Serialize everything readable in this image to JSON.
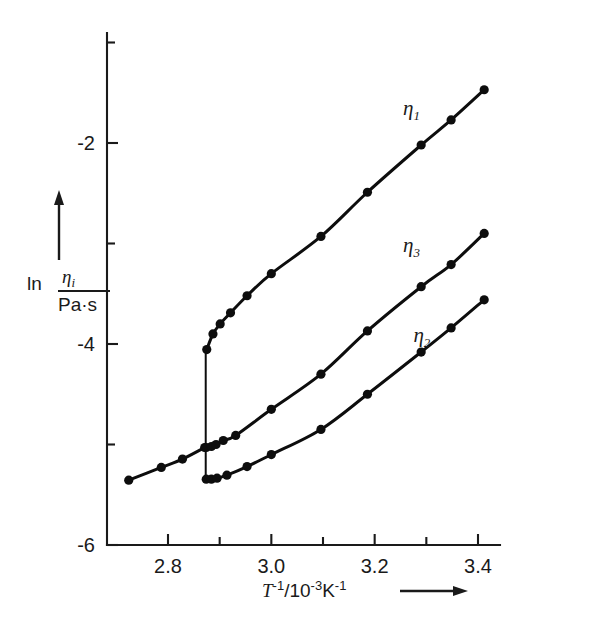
{
  "chart_data": {
    "type": "line",
    "title": "",
    "xlabel": "T^-1 / 10^-3 K^-1",
    "ylabel": "ln ( eta_i / Pa·s )",
    "xlim": [
      2.715,
      3.475
    ],
    "ylim": [
      -6.0,
      -1.28
    ],
    "xticks": [
      2.8,
      3.0,
      3.2,
      3.4
    ],
    "xticklabels": [
      "2.8",
      "3.0",
      "3.2",
      "3.4"
    ],
    "xminorticks": [
      2.9,
      3.1,
      3.3
    ],
    "yticks": [
      -2,
      -4,
      -6
    ],
    "yticklabels": [
      "-2",
      "-4",
      "-6"
    ],
    "yminorticks": [
      -1,
      -3,
      -5
    ],
    "grid": false,
    "legend_position": "inline-right",
    "annotations": [
      {
        "text": "eta_1",
        "x": 3.255,
        "y": -1.72
      },
      {
        "text": "eta_3",
        "x": 3.255,
        "y": -3.08
      },
      {
        "text": "eta_2",
        "x": 3.275,
        "y": -3.98
      }
    ],
    "transition_x": 2.873,
    "series": [
      {
        "name": "common-low-branch",
        "label": "shared branch",
        "points": [
          {
            "x": 2.724,
            "y": -5.355
          },
          {
            "x": 2.787,
            "y": -5.228
          },
          {
            "x": 2.828,
            "y": -5.145
          },
          {
            "x": 2.871,
            "y": -5.03
          }
        ]
      },
      {
        "name": "eta_1",
        "label": "η₁",
        "points": [
          {
            "x": 2.875,
            "y": -4.055
          },
          {
            "x": 2.887,
            "y": -3.9
          },
          {
            "x": 2.901,
            "y": -3.8
          },
          {
            "x": 2.921,
            "y": -3.69
          },
          {
            "x": 2.953,
            "y": -3.52
          },
          {
            "x": 3.0,
            "y": -3.3
          },
          {
            "x": 3.096,
            "y": -2.93
          },
          {
            "x": 3.186,
            "y": -2.49
          },
          {
            "x": 3.29,
            "y": -2.02
          },
          {
            "x": 3.348,
            "y": -1.77
          },
          {
            "x": 3.412,
            "y": -1.47
          }
        ]
      },
      {
        "name": "eta_3",
        "label": "η₃",
        "points": [
          {
            "x": 2.874,
            "y": -5.03
          },
          {
            "x": 2.884,
            "y": -5.02
          },
          {
            "x": 2.893,
            "y": -5.0
          },
          {
            "x": 2.907,
            "y": -4.96
          },
          {
            "x": 2.931,
            "y": -4.91
          },
          {
            "x": 3.0,
            "y": -4.65
          },
          {
            "x": 3.096,
            "y": -4.3
          },
          {
            "x": 3.186,
            "y": -3.87
          },
          {
            "x": 3.29,
            "y": -3.43
          },
          {
            "x": 3.348,
            "y": -3.21
          },
          {
            "x": 3.412,
            "y": -2.9
          }
        ]
      },
      {
        "name": "eta_2",
        "label": "η₂",
        "points": [
          {
            "x": 2.874,
            "y": -5.345
          },
          {
            "x": 2.884,
            "y": -5.345
          },
          {
            "x": 2.895,
            "y": -5.335
          },
          {
            "x": 2.914,
            "y": -5.305
          },
          {
            "x": 2.953,
            "y": -5.22
          },
          {
            "x": 3.0,
            "y": -5.1
          },
          {
            "x": 3.096,
            "y": -4.85
          },
          {
            "x": 3.186,
            "y": -4.5
          },
          {
            "x": 3.29,
            "y": -4.08
          },
          {
            "x": 3.348,
            "y": -3.84
          },
          {
            "x": 3.412,
            "y": -3.56
          }
        ]
      }
    ],
    "jump_segment": {
      "x": 2.873,
      "y_top": -4.06,
      "y_bottom": -5.37,
      "description": "vertical discontinuity line at the transition"
    }
  },
  "axis": {
    "x_label_main": "T",
    "x_label_exp": "-1",
    "x_label_tail": "/10",
    "x_label_exp2": "-3",
    "x_label_unit": "K",
    "x_label_exp3": "-1",
    "y_label_ln": "ln",
    "y_label_num": "η",
    "y_label_num_sub": "i",
    "y_label_den": "Pa·s"
  },
  "colors": {
    "ink": "#0d0d0d",
    "axis": "#1a1a1a",
    "background": "#ffffff"
  }
}
